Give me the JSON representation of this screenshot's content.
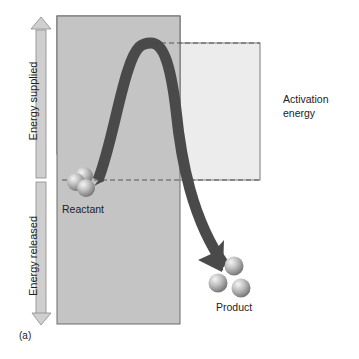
{
  "diagram": {
    "type": "energy-profile",
    "labels": {
      "energy_supplied": "Energy supplied",
      "energy_released": "Energy released",
      "activation_energy_line1": "Activation",
      "activation_energy_line2": "energy",
      "reactant": "Reactant",
      "product": "Product",
      "panel_label": "(a)"
    },
    "colors": {
      "panel_fill": "#c4c4c4",
      "activation_box_fill": "#ececec",
      "curve": "#4a4a4a",
      "arrow_fill": "#cfcfcf",
      "sphere": "#b8b8b8",
      "dashed_line": "#555555"
    }
  }
}
